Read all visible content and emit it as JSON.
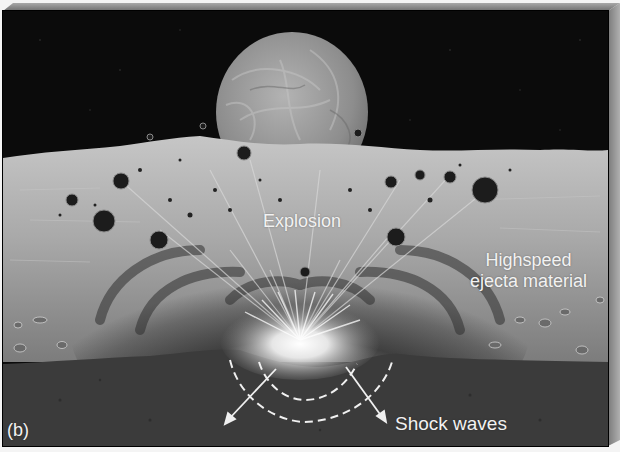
{
  "figure": {
    "panel_label": "(b)",
    "annotations": {
      "explosion": "Explosion",
      "ejecta_line1": "Highspeed",
      "ejecta_line2": "ejecta material",
      "shock_waves": "Shock waves"
    }
  },
  "scene": {
    "elements": [
      "starry-black-sky",
      "planet-on-horizon",
      "lunar-surface",
      "ejecta-rocks",
      "impact-crater-glow",
      "subsurface-layer",
      "shock-wave-arcs",
      "shock-wave-arrows"
    ]
  },
  "colors": {
    "sky": "#0b0b0b",
    "planet": "#9a9a9a",
    "surface": "#b4b4b4",
    "subsurface": "#3a3a3a",
    "frame_bevel": "#8c8c8c",
    "text": "#f2f2f2"
  }
}
